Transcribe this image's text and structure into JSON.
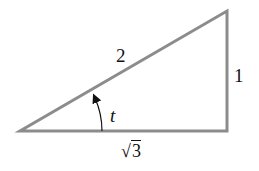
{
  "diagram": {
    "type": "right-triangle",
    "stroke_color": "#8c8c8c",
    "text_color": "#111111",
    "vertices": {
      "bottom_left": [
        20,
        131
      ],
      "bottom_right": [
        227,
        131
      ],
      "top_right": [
        227,
        11
      ]
    },
    "labels": {
      "hypotenuse": "2",
      "opposite": "1",
      "adjacent_radicand": "3",
      "adjacent_symbol": "√",
      "angle": "t"
    }
  }
}
